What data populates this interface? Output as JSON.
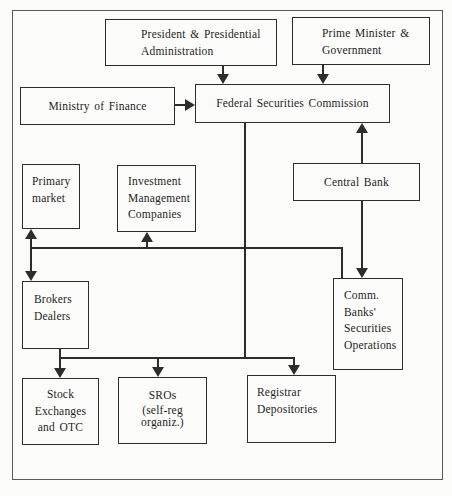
{
  "colors": {
    "ink": "#2d2d2d",
    "frame": "#595959",
    "text": "#1e1e1e",
    "background": "#fcfcfa"
  },
  "nodes": {
    "president": {
      "lines": [
        "President & Presidential",
        "Administration"
      ]
    },
    "prime_minister": {
      "lines": [
        "Prime Minister &",
        "Government"
      ]
    },
    "ministry_finance": {
      "lines": [
        "Ministry of Finance"
      ]
    },
    "fsc": {
      "lines": [
        "Federal Securities Commission"
      ]
    },
    "primary_market": {
      "lines": [
        "Primary",
        "market"
      ]
    },
    "investment_management": {
      "lines": [
        "Investment",
        "Management",
        "Companies"
      ]
    },
    "central_bank": {
      "lines": [
        "Central Bank"
      ]
    },
    "brokers_dealers": {
      "lines": [
        "Brokers",
        "Dealers"
      ]
    },
    "comm_banks": {
      "lines": [
        "Comm.",
        "Banks'",
        "Securities",
        "Operations"
      ]
    },
    "stock_exchanges": {
      "lines": [
        "Stock",
        "Exchanges",
        "and OTC"
      ]
    },
    "sros": {
      "lines": [
        "SROs",
        "(self-reg",
        "organiz.)"
      ]
    },
    "registrar_depositories": {
      "lines": [
        "Registrar",
        "Depositories"
      ]
    }
  }
}
